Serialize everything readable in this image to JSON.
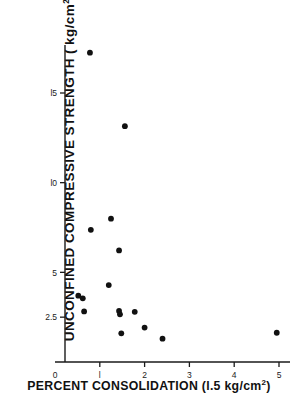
{
  "chart_data": {
    "type": "scatter",
    "title": "",
    "xlabel": "PERCENT  CONSOLIDATION (l.5 kg/cm",
    "xlabel_sup": "2",
    "xlabel_tail": ")",
    "ylabel": "UNCONFINED COMPRESSIVE STRENGTH ( kg/cm",
    "ylabel_sup": "2",
    "ylabel_tail": " )",
    "xlim": [
      0,
      5.35
    ],
    "ylim": [
      0,
      18.6
    ],
    "grid": false,
    "legend": false,
    "xticks": [
      {
        "value": 0,
        "label": "0"
      },
      {
        "value": 1,
        "label": "l"
      },
      {
        "value": 2,
        "label": "2"
      },
      {
        "value": 3,
        "label": "3"
      },
      {
        "value": 4,
        "label": "4"
      },
      {
        "value": 5,
        "label": "5"
      }
    ],
    "yticks": [
      {
        "value": 2.5,
        "label": "2.5"
      },
      {
        "value": 5,
        "label": "5"
      },
      {
        "value": 10,
        "label": "l0"
      },
      {
        "value": 15,
        "label": "l5"
      }
    ],
    "marker": {
      "shape": "circle",
      "color": "#111111",
      "size_px": 4.6
    },
    "points": [
      {
        "x": 0.78,
        "y": 17.25
      },
      {
        "x": 1.56,
        "y": 13.15
      },
      {
        "x": 1.25,
        "y": 7.99
      },
      {
        "x": 0.8,
        "y": 7.37
      },
      {
        "x": 1.43,
        "y": 6.22
      },
      {
        "x": 1.2,
        "y": 4.29
      },
      {
        "x": 0.52,
        "y": 3.7
      },
      {
        "x": 0.62,
        "y": 3.55
      },
      {
        "x": 0.65,
        "y": 2.82
      },
      {
        "x": 1.43,
        "y": 2.85
      },
      {
        "x": 1.45,
        "y": 2.66
      },
      {
        "x": 1.78,
        "y": 2.8
      },
      {
        "x": 2.0,
        "y": 1.92
      },
      {
        "x": 1.48,
        "y": 1.6
      },
      {
        "x": 2.4,
        "y": 1.3
      },
      {
        "x": 4.95,
        "y": 1.63
      }
    ],
    "axes": {
      "x_axis_px": {
        "x0": 55,
        "x1": 290,
        "y": 362
      },
      "y_axis_px": {
        "y0": 362,
        "y1": 45,
        "x": 65
      }
    }
  }
}
